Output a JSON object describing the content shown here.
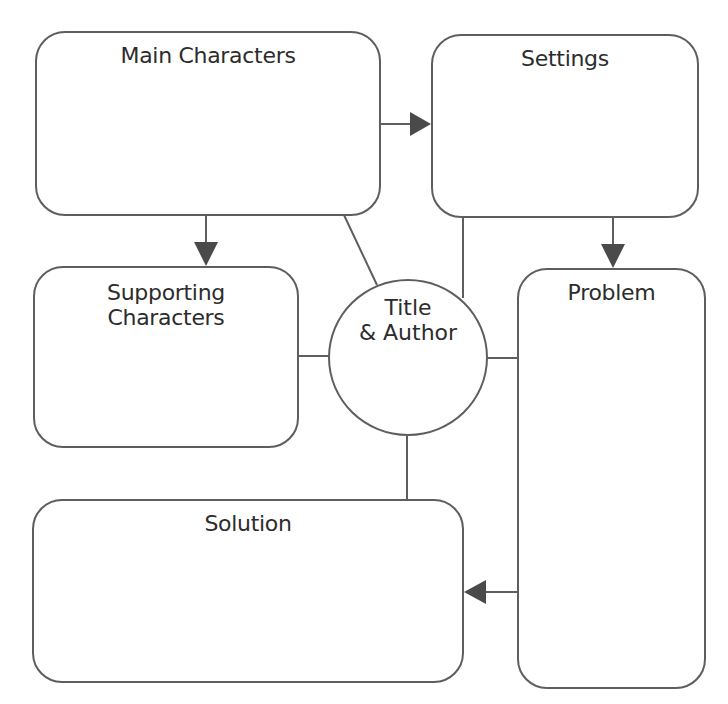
{
  "diagram": {
    "type": "story-map graphic organizer",
    "stroke_color": "#5e5e5e",
    "arrow_color": "#4a4a4a",
    "nodes": {
      "main_characters": {
        "label": "Main Characters"
      },
      "settings": {
        "label": "Settings"
      },
      "supporting_characters": {
        "label_line1": "Supporting",
        "label_line2": "Characters"
      },
      "title_author": {
        "label_line1": "Title",
        "label_line2": "& Author"
      },
      "problem": {
        "label": "Problem"
      },
      "solution": {
        "label": "Solution"
      }
    },
    "edges": [
      {
        "from": "Main Characters",
        "to": "Settings",
        "arrow": true
      },
      {
        "from": "Main Characters",
        "to": "Supporting Characters",
        "arrow": true
      },
      {
        "from": "Settings",
        "to": "Problem",
        "arrow": true
      },
      {
        "from": "Problem",
        "to": "Solution",
        "arrow": true
      },
      {
        "from": "Title & Author",
        "to": "Main Characters",
        "arrow": false
      },
      {
        "from": "Title & Author",
        "to": "Settings",
        "arrow": false
      },
      {
        "from": "Title & Author",
        "to": "Supporting Characters",
        "arrow": false
      },
      {
        "from": "Title & Author",
        "to": "Problem",
        "arrow": false
      },
      {
        "from": "Title & Author",
        "to": "Solution",
        "arrow": false
      }
    ]
  }
}
